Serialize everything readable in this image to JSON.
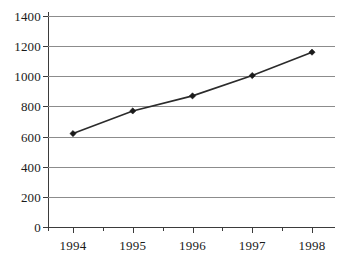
{
  "chart_data": {
    "type": "line",
    "title": "",
    "subtitle": "",
    "xlabel": "",
    "ylabel": "",
    "categories": [
      "1994",
      "1995",
      "1996",
      "1997",
      "1998"
    ],
    "x": [
      1994,
      1995,
      1996,
      1997,
      1998
    ],
    "values": [
      620,
      770,
      870,
      1005,
      1160
    ],
    "series": [
      {
        "name": "",
        "values": [
          620,
          770,
          870,
          1005,
          1160
        ]
      }
    ],
    "ylim": [
      0,
      1400
    ],
    "ytick_step": 200,
    "yticks": [
      0,
      200,
      400,
      600,
      800,
      1000,
      1200,
      1400
    ],
    "ytick_labels": [
      "0",
      "200",
      "400",
      "600",
      "800",
      "1000",
      "1200",
      "1400"
    ],
    "xtick_labels": [
      "1994",
      "1995",
      "1996",
      "1997",
      "1998"
    ],
    "grid": true,
    "grid_axis": "y",
    "legend": false,
    "legend_position": "none",
    "marker": "diamond",
    "annotations": []
  },
  "style": {
    "background_color": "#ffffff",
    "grid_color": "#8c8c8c",
    "axis_color": "#3b3b3b",
    "line_color": "#2b2b2b",
    "marker_color": "#1a1a1a",
    "text_color": "#1a1a1a"
  }
}
